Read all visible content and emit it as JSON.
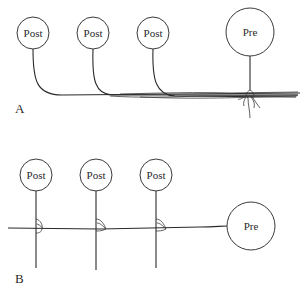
{
  "diagram": {
    "panels": [
      {
        "id": "A",
        "label": "A",
        "description": "Postsynaptic cells' axons converge onto a presynaptic cell axon bundle",
        "cells": [
          {
            "label": "Post",
            "type": "postsynaptic"
          },
          {
            "label": "Post",
            "type": "postsynaptic"
          },
          {
            "label": "Post",
            "type": "postsynaptic"
          },
          {
            "label": "Pre",
            "type": "presynaptic"
          }
        ]
      },
      {
        "id": "B",
        "label": "B",
        "description": "Presynaptic axon runs horizontally contacting vertical postsynaptic processes",
        "cells": [
          {
            "label": "Post",
            "type": "postsynaptic"
          },
          {
            "label": "Post",
            "type": "postsynaptic"
          },
          {
            "label": "Post",
            "type": "postsynaptic"
          },
          {
            "label": "Pre",
            "type": "presynaptic"
          }
        ]
      }
    ],
    "colors": {
      "stroke": "#2a2a2a",
      "background": "#ffffff"
    }
  }
}
